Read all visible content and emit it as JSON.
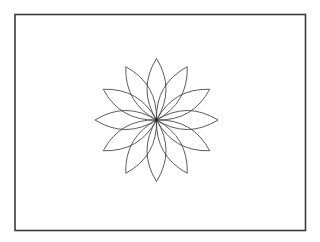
{
  "canvas": {
    "width": 320,
    "height": 242,
    "background": "#ffffff"
  },
  "frame": {
    "x": 15,
    "y": 14.5,
    "width": 290.5,
    "height": 216,
    "stroke": "#3a3a3a",
    "stroke_width": 1.6
  },
  "flower": {
    "center_x": 156.5,
    "center_y": 120,
    "petal_count": 12,
    "petal_length": 61.5,
    "petal_width": 19,
    "start_angle_deg": 0,
    "stroke": "#4a4a4a",
    "stroke_width": 0.9,
    "fill": "none",
    "center_dot_radius": 1.4,
    "center_dot_color": "#222222"
  }
}
